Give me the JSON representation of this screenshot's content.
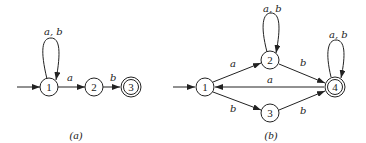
{
  "diagram_a": {
    "caption": "(a)",
    "states": [
      {
        "id": "1",
        "label": "1",
        "accepting": false,
        "start": true
      },
      {
        "id": "2",
        "label": "2",
        "accepting": false
      },
      {
        "id": "3",
        "label": "3",
        "accepting": true
      }
    ],
    "transitions": [
      {
        "from": "1",
        "to": "1",
        "label": "a, b"
      },
      {
        "from": "1",
        "to": "2",
        "label": "a"
      },
      {
        "from": "2",
        "to": "3",
        "label": "b"
      }
    ]
  },
  "diagram_b": {
    "caption": "(b)",
    "states": [
      {
        "id": "1",
        "label": "1",
        "accepting": false,
        "start": true
      },
      {
        "id": "2",
        "label": "2",
        "accepting": false
      },
      {
        "id": "3",
        "label": "3",
        "accepting": false
      },
      {
        "id": "4",
        "label": "4",
        "accepting": true
      }
    ],
    "transitions": [
      {
        "from": "1",
        "to": "2",
        "label": "a"
      },
      {
        "from": "1",
        "to": "3",
        "label": "b"
      },
      {
        "from": "1",
        "to": "4",
        "label": "a"
      },
      {
        "from": "2",
        "to": "2",
        "label": "a, b"
      },
      {
        "from": "2",
        "to": "4",
        "label": "b"
      },
      {
        "from": "3",
        "to": "4",
        "label": "b"
      },
      {
        "from": "4",
        "to": "4",
        "label": "a, b"
      }
    ]
  },
  "colors": {
    "stroke": "#222222",
    "background": "#ffffff"
  }
}
